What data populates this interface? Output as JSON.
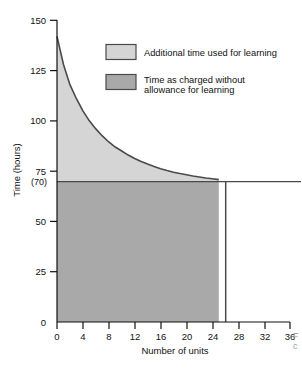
{
  "chart_data": {
    "type": "area",
    "title": "",
    "xlabel": "Number of units",
    "ylabel": "Time (hours)",
    "xlim": [
      0,
      36
    ],
    "ylim": [
      0,
      150
    ],
    "grid": false,
    "legend_position": "inside-top-right",
    "x_ticks": [
      0,
      4,
      8,
      12,
      16,
      20,
      24,
      28,
      32,
      36
    ],
    "x_tick_labels": [
      "0",
      "4",
      "8",
      "12",
      "16",
      "20",
      "24",
      "28",
      "32",
      "36"
    ],
    "y_ticks": [
      0,
      25,
      50,
      75,
      100,
      125,
      150
    ],
    "y_tick_labels": [
      "0",
      "25",
      "50",
      "75",
      "100",
      "125",
      "150"
    ],
    "special_y_tick": {
      "value": 70,
      "label": "(70)"
    },
    "steady_state_hours": 70,
    "initial_hours": 142,
    "shaded_region_end_units": 25,
    "series": [
      {
        "name": "Learning curve (cumulative average time per unit)",
        "x": [
          0,
          1,
          2,
          3,
          4,
          5,
          6,
          7,
          8,
          9,
          10,
          11,
          12,
          13,
          14,
          15,
          16,
          17,
          18,
          19,
          20,
          21,
          22,
          23,
          24,
          25
        ],
        "values": [
          142,
          128,
          118,
          111,
          105,
          100,
          96,
          92.5,
          89.5,
          87,
          85,
          83,
          81.3,
          79.8,
          78.5,
          77.3,
          76.2,
          75.3,
          74.5,
          73.8,
          73.2,
          72.6,
          72.1,
          71.6,
          71.2,
          70.8
        ]
      },
      {
        "name": "Time as charged without allowance for learning",
        "x": [
          0,
          25
        ],
        "values": [
          70,
          70
        ]
      }
    ],
    "areas": [
      {
        "name": "Additional time used for learning",
        "color": "#d5d5d5",
        "between": [
          "learning-curve",
          "70-line"
        ]
      },
      {
        "name": "Time as charged without allowance for learning",
        "color": "#a9a9a9",
        "between": [
          "70-line",
          "0-baseline"
        ]
      }
    ]
  },
  "legend": {
    "items": [
      {
        "swatch_color": "#d5d5d5",
        "label_line1": "Additional time used for learning",
        "label_line2": ""
      },
      {
        "swatch_color": "#a9a9a9",
        "label_line1": "Time as charged without",
        "label_line2": "allowance for learning"
      }
    ]
  },
  "axes": {
    "y_title": "Time (hours)",
    "x_title": "Number of units",
    "y_tick_150": "150",
    "y_tick_125": "125",
    "y_tick_100": "100",
    "y_tick_75": "75",
    "y_tick_70": "(70)",
    "y_tick_50": "50",
    "y_tick_25": "25",
    "y_tick_0": "0",
    "x_tick_0": "0",
    "x_tick_4": "4",
    "x_tick_8": "8",
    "x_tick_12": "12",
    "x_tick_16": "16",
    "x_tick_20": "20",
    "x_tick_24": "24",
    "x_tick_28": "28",
    "x_tick_32": "32",
    "x_tick_36": "36"
  },
  "caption_fragment": {
    "line1": "F",
    "line2": "c"
  },
  "colors": {
    "light_area": "#d5d5d5",
    "dark_area": "#a9a9a9",
    "curve": "#4a4a4a",
    "axis": "#111111",
    "background": "#ffffff"
  }
}
